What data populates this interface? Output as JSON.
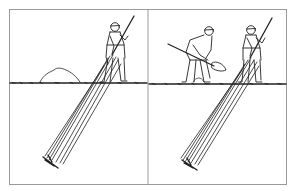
{
  "figure": {
    "panels": [
      {
        "id": "left",
        "scene": "one worker pushing long angled rod into ground beside a soil mound"
      },
      {
        "id": "right",
        "scene": "one worker shoveling while second worker pushes long angled rod into ground"
      }
    ],
    "colors": {
      "line": "#222222",
      "frame": "#9a9a9a",
      "background": "#ffffff"
    }
  }
}
